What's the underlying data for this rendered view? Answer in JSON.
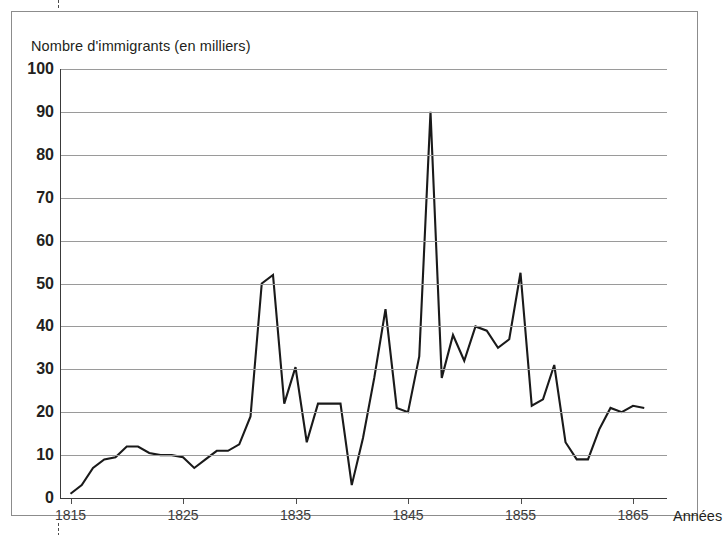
{
  "figure": {
    "y_axis_caption": "Nombre d'immigrants (en milliers)",
    "x_axis_caption": "Années"
  },
  "chart_data": {
    "type": "line",
    "title": "",
    "subtitle": "",
    "ylabel": "Nombre d'immigrants (en milliers)",
    "xlabel": "Années",
    "xlim": [
      1814,
      1867
    ],
    "ylim": [
      0,
      100
    ],
    "ytick_labels": [
      "0",
      "10",
      "20",
      "30",
      "40",
      "50",
      "60",
      "70",
      "80",
      "90",
      "100"
    ],
    "yticks": [
      0,
      10,
      20,
      30,
      40,
      50,
      60,
      70,
      80,
      90,
      100
    ],
    "xtick_labels": [
      "1815",
      "1825",
      "1835",
      "1845",
      "1855",
      "1865"
    ],
    "xticks": [
      1815,
      1825,
      1835,
      1845,
      1855,
      1865
    ],
    "grid": "horizontal",
    "legend": "none",
    "line_color": "#1a1a1a",
    "grid_color": "#9a9a9a",
    "series": [
      {
        "name": "Immigrants",
        "x": [
          1815,
          1816,
          1817,
          1818,
          1819,
          1820,
          1821,
          1822,
          1823,
          1824,
          1825,
          1826,
          1827,
          1828,
          1829,
          1830,
          1831,
          1832,
          1833,
          1834,
          1835,
          1836,
          1837,
          1838,
          1839,
          1840,
          1841,
          1842,
          1843,
          1844,
          1845,
          1846,
          1847,
          1848,
          1849,
          1850,
          1851,
          1852,
          1853,
          1854,
          1855,
          1856,
          1857,
          1858,
          1859,
          1860,
          1861,
          1862,
          1863,
          1864,
          1865,
          1866
        ],
        "values": [
          1,
          3,
          7,
          9,
          9.5,
          12,
          12,
          10.5,
          10,
          10,
          9.5,
          7,
          9,
          11,
          11,
          12.5,
          19,
          50,
          52,
          22,
          30.5,
          13,
          22,
          22,
          22,
          3,
          14,
          28,
          44,
          21,
          20,
          33,
          90,
          28,
          38,
          32,
          40,
          39,
          35,
          37,
          52.5,
          21.5,
          23,
          31,
          13,
          9,
          9,
          16,
          21,
          20,
          21.5,
          21
        ]
      }
    ]
  }
}
